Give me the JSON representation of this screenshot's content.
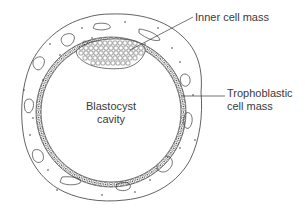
{
  "diagram": {
    "labels": {
      "inner_cell_mass": "Inner cell mass",
      "trophoblast_line1": "Trophoblastic",
      "trophoblast_line2": "cell mass",
      "cavity_line1": "Blastocyst",
      "cavity_line2": "cavity"
    },
    "colors": {
      "stroke": "#3a3a3a",
      "background": "#ffffff",
      "text": "#3a3a3a"
    }
  }
}
